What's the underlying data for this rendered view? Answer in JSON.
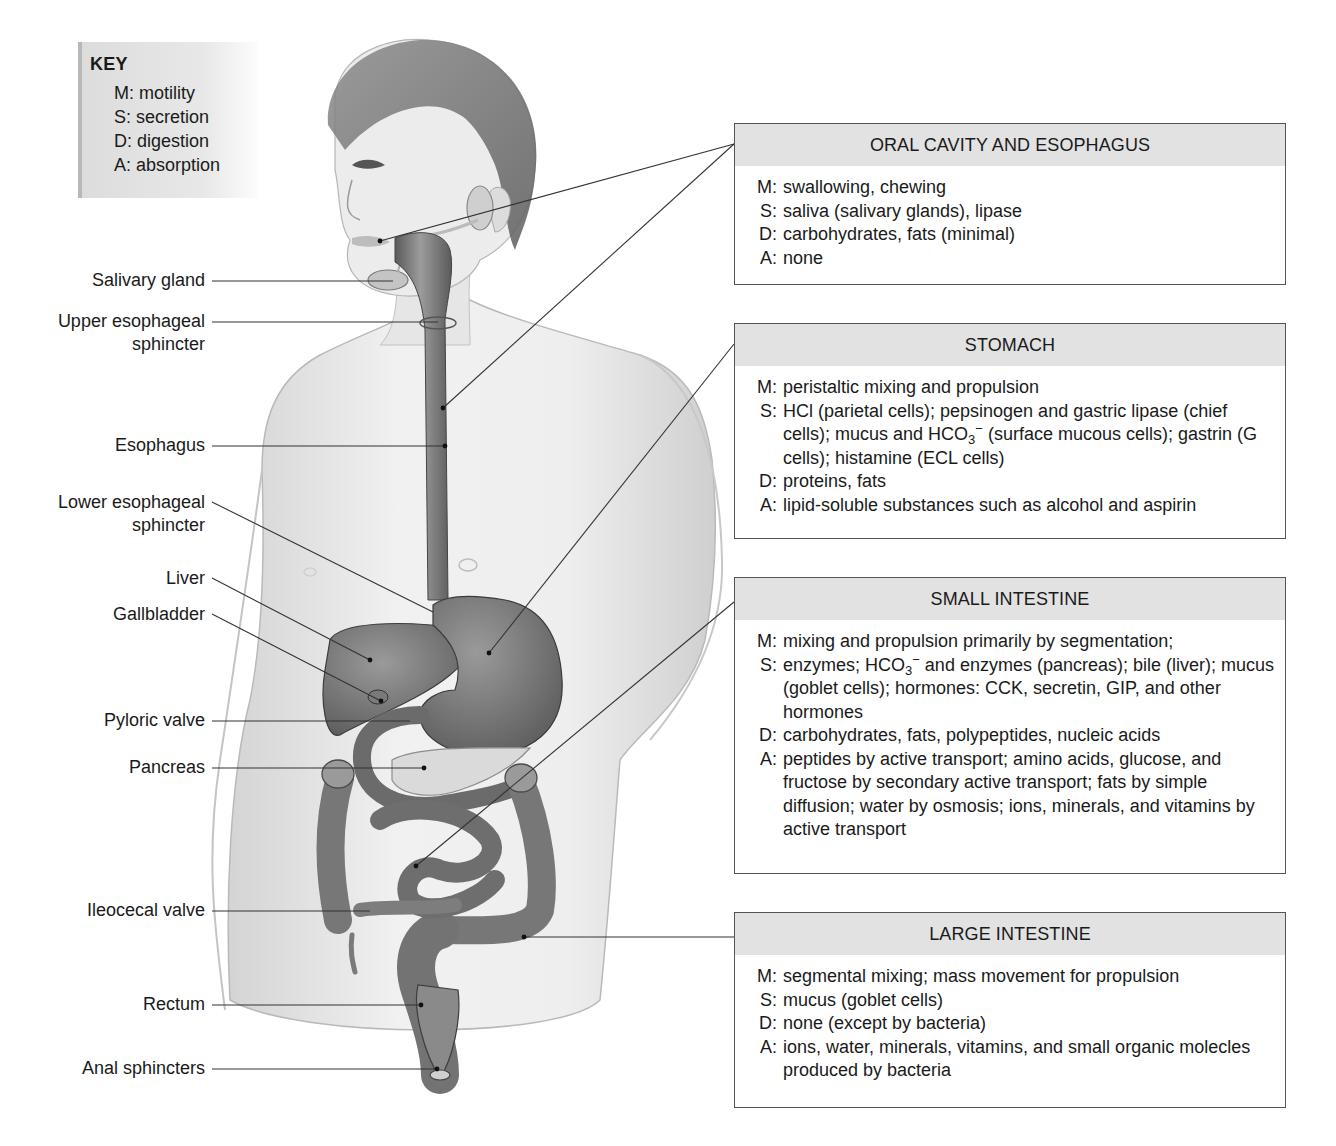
{
  "key": {
    "title": "KEY",
    "items": [
      "M: motility",
      "S: secretion",
      "D: digestion",
      "A: absorption"
    ]
  },
  "labels": [
    {
      "id": "salivary-gland",
      "text": "Salivary gland"
    },
    {
      "id": "upper-esophageal-sphincter",
      "text": "Upper esophageal sphincter",
      "line1": "Upper esophageal",
      "line2": "sphincter"
    },
    {
      "id": "esophagus",
      "text": "Esophagus"
    },
    {
      "id": "lower-esophageal-sphincter",
      "text": "Lower esophageal sphincter",
      "line1": "Lower esophageal",
      "line2": "sphincter"
    },
    {
      "id": "liver",
      "text": "Liver"
    },
    {
      "id": "gallbladder",
      "text": "Gallbladder"
    },
    {
      "id": "pyloric-valve",
      "text": "Pyloric valve"
    },
    {
      "id": "pancreas",
      "text": "Pancreas"
    },
    {
      "id": "ileocecal-valve",
      "text": "Ileocecal valve"
    },
    {
      "id": "rectum",
      "text": "Rectum"
    },
    {
      "id": "anal-sphincters",
      "text": "Anal sphincters"
    }
  ],
  "boxes": [
    {
      "title": "ORAL CAVITY AND ESOPHAGUS",
      "M": "swallowing, chewing",
      "S": "saliva (salivary glands), lipase",
      "D": "carbohydrates, fats (minimal)",
      "A": "none"
    },
    {
      "title": "STOMACH",
      "M": "peristaltic mixing and propulsion",
      "S_a": "HCl (parietal cells); pepsinogen and gastric lipase (chief cells); mucus and HCO",
      "S_sub": "3",
      "S_sup": "−",
      "S_b": " (surface mucous cells); gastrin (G cells); histamine (ECL cells)",
      "D": "proteins, fats",
      "A": "lipid-soluble substances such as alcohol and aspirin"
    },
    {
      "title": "SMALL INTESTINE",
      "M": "mixing and propulsion primarily by segmentation;",
      "S_a": "enzymes; HCO",
      "S_sub": "3",
      "S_sup": "−",
      "S_b": " and enzymes (pancreas); bile (liver); mucus (goblet cells); hormones: CCK, secretin, GIP, and other hormones",
      "D": "carbohydrates, fats, polypeptides, nucleic acids",
      "A": "peptides by active transport; amino acids, glucose, and fructose by secondary active transport; fats by simple diffusion; water by osmosis; ions, minerals, and vitamins by active transport"
    },
    {
      "title": "LARGE INTESTINE",
      "M": "segmental mixing; mass movement for propulsion",
      "S": "mucus (goblet  cells)",
      "D": "none (except by bacteria)",
      "A": "ions, water, minerals, vitamins, and small organic molecles produced by bacteria"
    }
  ],
  "codes": {
    "M": "M:",
    "S": "S:",
    "D": "D:",
    "A": "A:"
  },
  "colors": {
    "organ": "#6e6e6e",
    "organ_light": "#8a8a8a",
    "skin": "#ececec",
    "header_fill": "#e2e2e2",
    "border": "#555555"
  }
}
